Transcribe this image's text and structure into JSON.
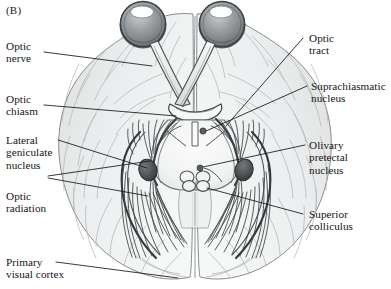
{
  "figure": {
    "panel_label": "(B)",
    "colors": {
      "background": "#ffffff",
      "brain_fill": "#e9eaea",
      "brain_fill_light": "#f3f4f4",
      "brain_outline": "#6f7475",
      "gyri_line": "#aeb3b4",
      "tract_line": "#3a3e40",
      "eye_sclera": "#8e9294",
      "eye_rim": "#4b4f51",
      "eye_highlight": "#ffffff",
      "nucleus_dark": "#4a4e50",
      "leader_line": "#1a1a1a",
      "text": "#141414"
    }
  },
  "labels_left": [
    {
      "id": "optic-nerve",
      "text": "Optic\nnerve"
    },
    {
      "id": "optic-chiasm",
      "text": "Optic\nchiasm"
    },
    {
      "id": "lateral-geniculate-nucleus",
      "text": "Lateral\ngeniculate\nnucleus"
    },
    {
      "id": "optic-radiation",
      "text": "Optic\nradiation"
    },
    {
      "id": "primary-visual-cortex",
      "text": "Primary\nvisual cortex"
    }
  ],
  "labels_right": [
    {
      "id": "optic-tract",
      "text": "Optic\ntract"
    },
    {
      "id": "suprachiasmatic-nucleus",
      "text": "Suprachiasmatic\nnucleus"
    },
    {
      "id": "olivary-pretectal-nucleus",
      "text": "Olivary\npretectal\nnucleus"
    },
    {
      "id": "superior-colliculus",
      "text": "Superior\ncolliculus"
    }
  ]
}
